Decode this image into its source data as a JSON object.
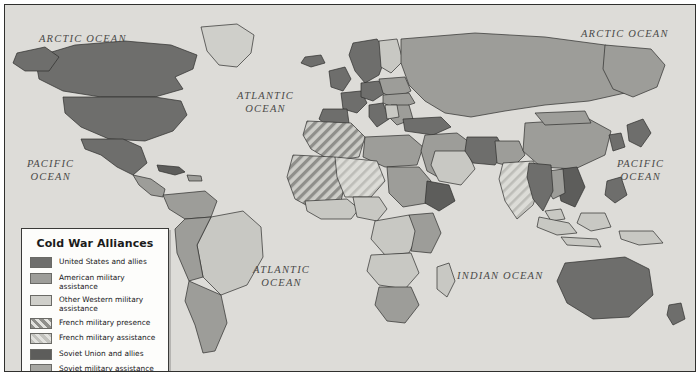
{
  "map": {
    "title": "Cold War Alliances",
    "ocean_labels": [
      {
        "name": "arctic-ocean-west",
        "text": "ARCTIC  OCEAN",
        "x": 34,
        "y": 27
      },
      {
        "name": "arctic-ocean-east",
        "text": "ARCTIC  OCEAN",
        "x": 576,
        "y": 22
      },
      {
        "name": "atlantic-ocean-north",
        "text": "ATLANTIC\nOCEAN",
        "x": 232,
        "y": 84
      },
      {
        "name": "pacific-ocean-west",
        "text": "PACIFIC\nOCEAN",
        "x": 22,
        "y": 152
      },
      {
        "name": "pacific-ocean-east",
        "text": "PACIFIC\nOCEAN",
        "x": 612,
        "y": 152
      },
      {
        "name": "atlantic-ocean-south",
        "text": "ATLANTIC\nOCEAN",
        "x": 248,
        "y": 258
      },
      {
        "name": "indian-ocean",
        "text": "INDIAN  OCEAN",
        "x": 452,
        "y": 264
      }
    ]
  },
  "legend": {
    "title": "Cold War Alliances",
    "items": [
      {
        "label": "United States and allies",
        "swatch_class": "sw-us",
        "color": "#6e6e6c",
        "pattern": "solid"
      },
      {
        "label": "American military assistance",
        "swatch_class": "sw-usaid",
        "color": "#9d9d99",
        "pattern": "solid"
      },
      {
        "label": "Other Western military assistance",
        "swatch_class": "sw-westaid",
        "color": "#cfcfca",
        "pattern": "solid"
      },
      {
        "label": "French military presence",
        "swatch_class": "sw-frpres",
        "color": "#8f8f8b",
        "pattern": "hatch"
      },
      {
        "label": "French military assistance",
        "swatch_class": "sw-fraid",
        "color": "#c2c2bd",
        "pattern": "hatch"
      },
      {
        "label": "Soviet Union and allies",
        "swatch_class": "sw-soviet",
        "color": "#5d5d5b",
        "pattern": "solid"
      },
      {
        "label": "Soviet military assistance",
        "swatch_class": "sw-sovaid",
        "color": "#a8a8a3",
        "pattern": "solid"
      },
      {
        "label": "Nonaligned nations",
        "swatch_class": "sw-nonalign",
        "color": "#c8c8c3",
        "pattern": "solid"
      }
    ]
  }
}
